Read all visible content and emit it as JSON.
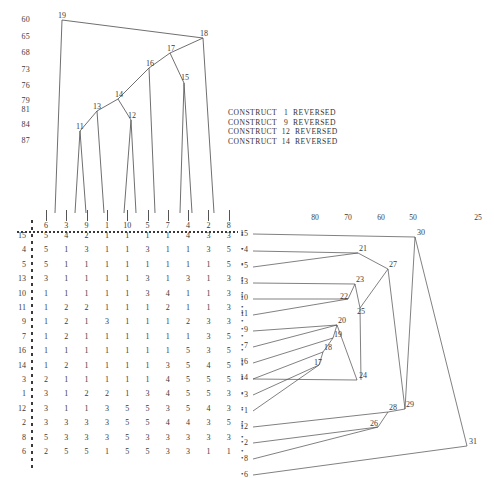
{
  "dendrogram": {
    "scale_labels": [
      "60",
      "65",
      "68",
      "73",
      "76",
      "79",
      "81",
      "84",
      "87"
    ],
    "leaf_labels": [
      "6",
      "3",
      "9",
      "1",
      "10",
      "5",
      "7",
      "4",
      "2",
      "8"
    ],
    "node_labels": [
      "19",
      "18",
      "17",
      "16",
      "15",
      "14",
      "13",
      "12",
      "11"
    ]
  },
  "constructs": {
    "lines": [
      "CONSTRUCT   1  REVERSED",
      "CONSTRUCT   9  REVERSED",
      "CONSTRUCT  12  REVERSED",
      "CONSTRUCT  14  REVERSED"
    ]
  },
  "matrix": {
    "column_headers": [
      "6",
      "3",
      "9",
      "1",
      "10",
      "5",
      "7",
      "4",
      "2",
      "8"
    ],
    "row_headers": [
      "15",
      "4",
      "5",
      "13",
      "10",
      "11",
      "9",
      "7",
      "16",
      "14",
      "3",
      "1",
      "12",
      "2",
      "8",
      "6"
    ],
    "rows": [
      [
        "5",
        "4",
        "2",
        "1",
        "1",
        "1",
        "1",
        "4",
        "3",
        "3"
      ],
      [
        "5",
        "1",
        "3",
        "1",
        "1",
        "3",
        "1",
        "1",
        "3",
        "5"
      ],
      [
        "5",
        "1",
        "1",
        "1",
        "1",
        "1",
        "1",
        "1",
        "1",
        "5"
      ],
      [
        "3",
        "1",
        "1",
        "1",
        "1",
        "3",
        "1",
        "3",
        "1",
        "3"
      ],
      [
        "1",
        "1",
        "1",
        "1",
        "1",
        "3",
        "4",
        "1",
        "1",
        "3"
      ],
      [
        "1",
        "2",
        "2",
        "1",
        "1",
        "1",
        "2",
        "1",
        "1",
        "3"
      ],
      [
        "1",
        "2",
        "1",
        "3",
        "1",
        "1",
        "1",
        "2",
        "3",
        "3"
      ],
      [
        "1",
        "2",
        "1",
        "1",
        "1",
        "1",
        "1",
        "1",
        "3",
        "5"
      ],
      [
        "1",
        "1",
        "1",
        "1",
        "1",
        "1",
        "1",
        "5",
        "3",
        "5"
      ],
      [
        "1",
        "2",
        "1",
        "1",
        "1",
        "1",
        "3",
        "5",
        "4",
        "5"
      ],
      [
        "2",
        "1",
        "1",
        "1",
        "1",
        "1",
        "4",
        "5",
        "5",
        "5"
      ],
      [
        "3",
        "1",
        "2",
        "2",
        "1",
        "3",
        "4",
        "5",
        "5",
        "3"
      ],
      [
        "3",
        "1",
        "1",
        "3",
        "5",
        "5",
        "3",
        "5",
        "4",
        "3"
      ],
      [
        "3",
        "3",
        "3",
        "3",
        "5",
        "5",
        "4",
        "4",
        "3",
        "5"
      ],
      [
        "5",
        "3",
        "3",
        "3",
        "5",
        "3",
        "3",
        "3",
        "3",
        "3"
      ],
      [
        "2",
        "5",
        "5",
        "1",
        "5",
        "5",
        "3",
        "3",
        "1",
        "1"
      ]
    ]
  },
  "linkage": {
    "scale_labels": [
      "80",
      "70",
      "60",
      "50",
      "25"
    ],
    "row_labels": [
      "15",
      "4",
      "5",
      "13",
      "10",
      "11",
      "9",
      "7",
      "16",
      "14",
      "3",
      "1",
      "12",
      "2",
      "8",
      "6"
    ],
    "node_labels": [
      "30",
      "21",
      "27",
      "23",
      "22",
      "25",
      "20",
      "19",
      "18",
      "17",
      "24",
      "29",
      "28",
      "26",
      "31"
    ]
  },
  "caption": {
    "text": ""
  }
}
